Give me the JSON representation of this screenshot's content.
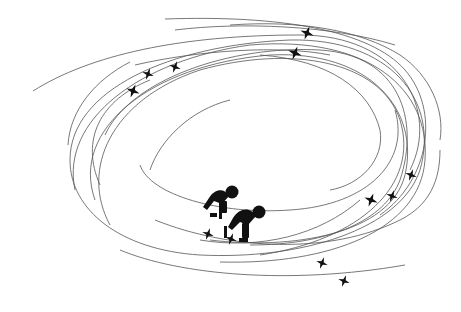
{
  "illustration": {
    "subject": "short-track speed skating",
    "background": "#ffffff",
    "line_color": "#555555",
    "ink_color": "#111111",
    "orbits": [
      "M 33 91 C 90 55, 180 35, 300 35 C 400 35, 440 110, 410 170",
      "M 165 19 C 280 15, 370 30, 405 70 C 440 110, 430 180, 380 215",
      "M 105 135 C 130 80, 230 45, 320 50 C 400 55, 420 120, 400 180 C 385 220, 330 245, 250 245",
      "M 70 160 C 70 90, 170 45, 290 40 C 390 38, 440 100, 420 170 C 400 230, 300 260, 200 255 C 120 250, 70 210, 70 160",
      "M 75 190 C 60 120, 140 60, 250 45 C 370 35, 430 90, 425 160 C 420 230, 330 265, 220 262",
      "M 95 200 C 70 130, 150 65, 270 55 C 370 50, 420 110, 405 175 C 390 235, 290 250, 210 240",
      "M 110 225 C 80 170, 110 100, 200 70 C 290 45, 380 60, 400 120 C 420 185, 360 240, 260 255",
      "M 140 165 C 150 195, 220 215, 290 210 C 370 205, 410 160, 395 110",
      "M 135 65 C 200 50, 280 45, 330 55",
      "M 175 30 C 240 22, 330 25, 395 45",
      "M 155 220 C 230 250, 330 255, 400 220 C 430 205, 440 180, 440 150",
      "M 120 250 C 180 275, 290 285, 405 265",
      "M 100 185 C 80 140, 100 100, 150 80",
      "M 260 55 C 330 60, 370 90, 380 130 C 385 160, 360 185, 330 190",
      "M 150 170 C 160 140, 190 110, 230 100",
      "M 200 240 C 260 250, 320 235, 360 200",
      "M 68 145 C 70 110, 95 80, 130 62",
      "M 230 25 C 300 20, 360 30, 400 55 C 430 75, 445 110, 440 140"
    ],
    "sparkles": [
      {
        "x": 133,
        "y": 91,
        "r": 7
      },
      {
        "x": 148,
        "y": 74,
        "r": 6
      },
      {
        "x": 175,
        "y": 67,
        "r": 6
      },
      {
        "x": 307,
        "y": 33,
        "r": 7
      },
      {
        "x": 295,
        "y": 53,
        "r": 7
      },
      {
        "x": 371,
        "y": 200,
        "r": 7
      },
      {
        "x": 392,
        "y": 196,
        "r": 6
      },
      {
        "x": 411,
        "y": 175,
        "r": 6
      },
      {
        "x": 208,
        "y": 234,
        "r": 6
      },
      {
        "x": 231,
        "y": 239,
        "r": 6
      },
      {
        "x": 322,
        "y": 263,
        "r": 6
      },
      {
        "x": 344,
        "y": 281,
        "r": 6
      }
    ]
  }
}
